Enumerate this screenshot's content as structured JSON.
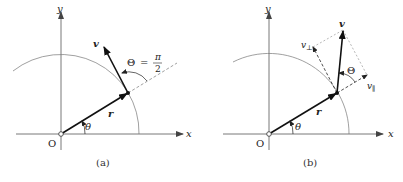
{
  "figure": {
    "panels": [
      {
        "id": "a",
        "caption": "(a)",
        "labels": {
          "x_axis": "x",
          "y_axis": "y",
          "origin": "O",
          "position_vector": "r",
          "velocity_vector": "v",
          "polar_angle": "θ",
          "angle_between": "Θ",
          "angle_equals": "=",
          "angle_num": "π",
          "angle_den": "2"
        }
      },
      {
        "id": "b",
        "caption": "(b)",
        "labels": {
          "x_axis": "x",
          "y_axis": "y",
          "origin": "O",
          "position_vector": "r",
          "velocity_vector": "v",
          "polar_angle": "θ",
          "angle_between": "Θ",
          "v_perp": "v",
          "v_perp_sub": "⊥",
          "v_par": "v",
          "v_par_sub": "∥"
        }
      }
    ],
    "colors": {
      "axis": "#555555",
      "vector": "#111111",
      "arc": "#777777",
      "dashed": "#666666"
    }
  }
}
